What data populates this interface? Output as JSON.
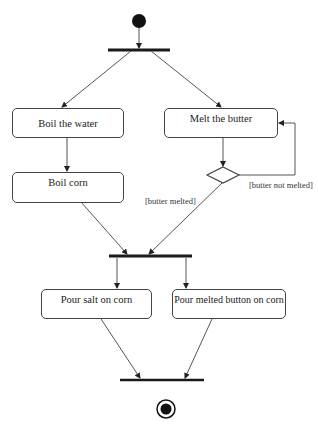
{
  "diagram": {
    "type": "UML activity diagram",
    "colors": {
      "line": "#555555",
      "bar": "#1a1a1a",
      "node_border": "#444444",
      "text": "#222222"
    },
    "start_node": {
      "label": "initial"
    },
    "activities": [
      {
        "id": "boil-water",
        "label": "Boil the water"
      },
      {
        "id": "melt-butter",
        "label": "Melt the butter"
      },
      {
        "id": "boil-corn",
        "label": "Boil corn"
      },
      {
        "id": "pour-salt",
        "label": "Pour salt on corn"
      },
      {
        "id": "pour-butter",
        "label": "Pour melted button on corn"
      }
    ],
    "guards": {
      "melted": "[butter melted]",
      "not_melted": "[butter not melted]"
    },
    "end_node": {
      "label": "final"
    }
  }
}
